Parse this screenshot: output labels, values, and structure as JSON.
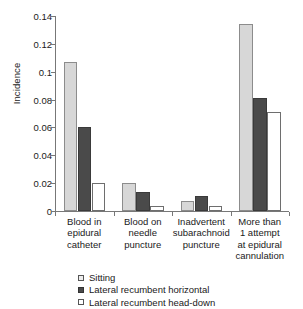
{
  "chart_data": {
    "type": "bar",
    "title": "",
    "xlabel": "",
    "ylabel": "Incidence",
    "ylim": [
      0,
      0.14
    ],
    "yticks": [
      0,
      0.02,
      0.04,
      0.06,
      0.08,
      0.1,
      0.12,
      0.14
    ],
    "ytick_labels": [
      "0",
      "0.02",
      "0.04",
      "0.06",
      "0.08",
      "0.1",
      "0.12",
      "0.14"
    ],
    "grid": false,
    "legend_position": "bottom",
    "categories": [
      "Blood in\nepidural\ncatheter",
      "Blood on\nneedle\npuncture",
      "Inadvertent\nsubarachnoid\npuncture",
      "More than\n1 attempt\nat epidural\ncannulation"
    ],
    "series": [
      {
        "name": "Sitting",
        "color": "#d7d7d7",
        "values": [
          0.107,
          0.02,
          0.0075,
          0.134
        ]
      },
      {
        "name": "Lateral recumbent horizontal",
        "color": "#4a4a4a",
        "values": [
          0.06,
          0.0133,
          0.0105,
          0.081
        ]
      },
      {
        "name": "Lateral recumbent head-down",
        "color": "#ffffff",
        "values": [
          0.02,
          0.0033,
          0.0035,
          0.071
        ]
      }
    ]
  },
  "legend": {
    "items": [
      {
        "label": "Sitting"
      },
      {
        "label": "Lateral recumbent horizontal"
      },
      {
        "label": "Lateral recumbent head-down"
      }
    ]
  }
}
